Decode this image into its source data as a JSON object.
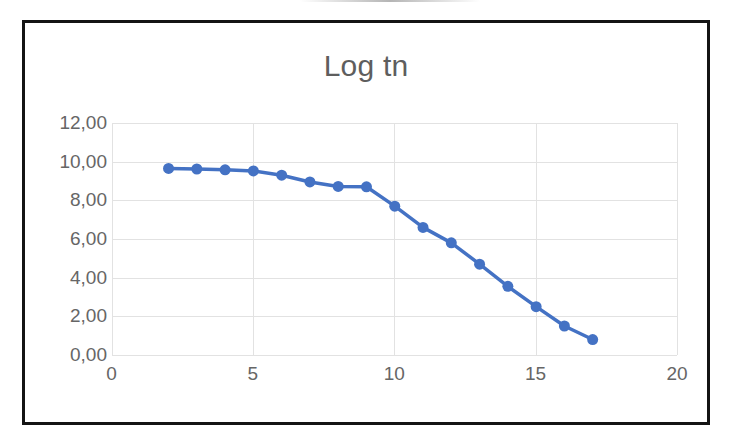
{
  "chart_data": {
    "type": "line",
    "title": "Log tn",
    "xlabel": "",
    "ylabel": "",
    "series": [
      {
        "name": "Log tn",
        "x": [
          2,
          3,
          4,
          5,
          6,
          7,
          8,
          9,
          10,
          11,
          12,
          13,
          14,
          15,
          16,
          17
        ],
        "values": [
          9.65,
          9.62,
          9.58,
          9.52,
          9.3,
          8.95,
          8.72,
          8.7,
          7.7,
          6.6,
          5.8,
          4.7,
          3.55,
          2.5,
          1.5,
          0.8
        ],
        "color": "#4472C4",
        "marker": "circle",
        "marker_size": 11,
        "line_width": 3.5
      }
    ],
    "xlim": [
      0,
      20
    ],
    "ylim": [
      0,
      12
    ],
    "xticks": [
      0,
      5,
      10,
      15,
      20
    ],
    "xtick_labels": [
      "0",
      "5",
      "10",
      "15",
      "20"
    ],
    "yticks": [
      0,
      2,
      4,
      6,
      8,
      10,
      12
    ],
    "ytick_labels": [
      "0,00",
      "2,00",
      "4,00",
      "6,00",
      "8,00",
      "10,00",
      "12,00"
    ],
    "grid": {
      "horizontal": true,
      "vertical": true,
      "color": "#E2E2E2"
    },
    "legend": {
      "visible": false,
      "position": "none"
    },
    "plot_background": "#FFFFFF",
    "frame_color": "#141414",
    "tick_label_color": "#666666",
    "title_color": "#5E5E5E"
  }
}
